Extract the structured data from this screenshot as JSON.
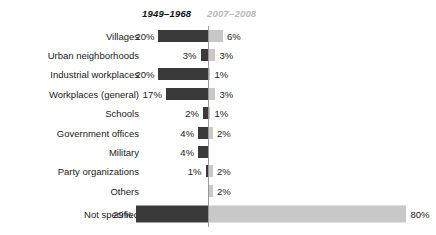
{
  "legend": {
    "past_label": "1949–1968",
    "recent_label": "2007–2008",
    "past_color": "#3a3a3a",
    "recent_color": "#c8c8c8"
  },
  "chart_data": {
    "type": "bar",
    "title": "",
    "subtitle": "",
    "xlabel": "",
    "ylabel": "",
    "orientation": "horizontal",
    "style": "diverging-bidirectional",
    "grid": false,
    "legend_position": "top",
    "axis_center_percent": 0,
    "unit": "%",
    "max_value": 80,
    "categories": [
      "Villages",
      "Urban neighborhoods",
      "Industrial workplaces",
      "Workplaces (general)",
      "Schools",
      "Government offices",
      "Military",
      "Party organizations",
      "Others",
      "Not specified"
    ],
    "series": [
      {
        "name": "1949–1968",
        "direction": "left",
        "color": "#3a3a3a",
        "values": [
          20,
          3,
          20,
          17,
          2,
          4,
          4,
          1,
          0,
          29
        ],
        "labels": [
          "20%",
          "3%",
          "20%",
          "17%",
          "2%",
          "4%",
          "4%",
          "1%",
          "",
          "29%"
        ]
      },
      {
        "name": "2007–2008",
        "direction": "right",
        "color": "#c8c8c8",
        "values": [
          6,
          3,
          1,
          3,
          1,
          2,
          0,
          2,
          2,
          80
        ],
        "labels": [
          "6%",
          "3%",
          "1%",
          "3%",
          "1%",
          "2%",
          "",
          "2%",
          "2%",
          "80%"
        ]
      }
    ]
  }
}
